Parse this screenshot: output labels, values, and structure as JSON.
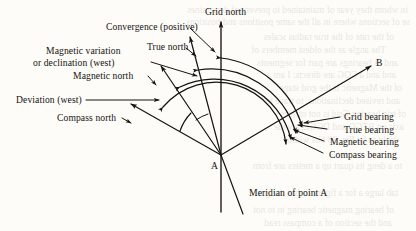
{
  "figure": {
    "type": "survey-bearing-diagram",
    "point_label": "A",
    "target_label": "B",
    "background_color": "#fdfcf8",
    "ink_color": "#151310"
  },
  "north_lines": {
    "grid_north": "Grid north",
    "true_north": "True north",
    "magnetic_north": "Magnetic north",
    "compass_north": "Compass north"
  },
  "angles": {
    "convergence": "Convergence (positive)",
    "magnetic_variation": "Magnetic variation",
    "magnetic_variation_line2": "or declination (west)",
    "deviation": "Deviation (west)"
  },
  "bearings": [
    {
      "label": "Grid bearing"
    },
    {
      "label": "True bearing"
    },
    {
      "label": "Magnetic bearing"
    },
    {
      "label": "Compass bearing"
    }
  ],
  "meridian": {
    "label": "Meridian of point A"
  },
  "ghost_text": [
    {
      "t": "in whom they year of maintained to prevent of determines",
      "x": 8,
      "y": 5
    },
    {
      "t": "se of sections where in all the same positions and positions",
      "x": 6,
      "y": 17
    },
    {
      "t": "of the rate of the true radius scales",
      "x": 22,
      "y": 32
    },
    {
      "t": "The angle as the oldest members of",
      "x": 30,
      "y": 45
    },
    {
      "t": "and as bearings are part for segments",
      "x": 18,
      "y": 58
    },
    {
      "t": "and and a COG are directs: I am a",
      "x": 20,
      "y": 70
    },
    {
      "t": "of the Magnetic is  the  grid  stage",
      "x": 14,
      "y": 83
    },
    {
      "t": "and revised declinations, to trace to",
      "x": 16,
      "y": 96
    },
    {
      "t": "of trig bearing Grid is not offices",
      "x": 10,
      "y": 109
    },
    {
      "t": "axis on BTGQ and DGGL, a wide",
      "x": 12,
      "y": 122
    },
    {
      "t": "right to  be   Fig. 28  bits width",
      "x": 20,
      "y": 135
    },
    {
      "t": "to a deng its quart up a meters are from",
      "x": 14,
      "y": 161
    },
    {
      "t": "tab large a for a figure fir has the grid",
      "x": 18,
      "y": 188
    },
    {
      "t": "of bearing magnetic bearing in to not",
      "x": 22,
      "y": 205
    },
    {
      "t": "and the section of a compass read",
      "x": 24,
      "y": 218
    }
  ]
}
